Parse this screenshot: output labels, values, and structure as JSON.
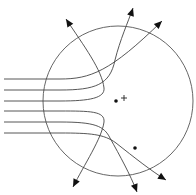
{
  "diagram": {
    "type": "scattering-trajectories",
    "circle": {
      "cx": 118,
      "cy": 101,
      "r": 75,
      "color": "#555555"
    },
    "markers": {
      "center_plus": {
        "x": 124,
        "y": 98,
        "symbol": "+"
      },
      "dots": [
        {
          "x": 116,
          "y": 101
        },
        {
          "x": 135,
          "y": 148
        }
      ]
    },
    "trajectories": [
      {
        "id": "t1",
        "path": "M4,79 L60,79 C90,79 110,72 162,21",
        "tip": {
          "x": 162,
          "y": 21,
          "angle": -44
        }
      },
      {
        "id": "t2",
        "path": "M4,90 L60,90 C95,90 110,85 115,60 C120,40 128,22 133,8",
        "tip": {
          "x": 133,
          "y": 8,
          "angle": -72
        }
      },
      {
        "id": "t3",
        "path": "M4,101 L60,101 C90,101 105,98 104,88 C102,70 84,46 66,19",
        "tip": {
          "x": 66,
          "y": 19,
          "angle": -123
        }
      },
      {
        "id": "t4",
        "path": "M4,111 L60,111 C90,111 105,111 104,122 C102,138 84,165 73,187",
        "tip": {
          "x": 73,
          "y": 187,
          "angle": 117
        }
      },
      {
        "id": "t5",
        "path": "M4,122 L60,122 C95,122 104,126 110,138 C120,156 130,174 137,192",
        "tip": {
          "x": 137,
          "y": 192,
          "angle": 70
        }
      },
      {
        "id": "t6",
        "path": "M4,133 L60,133 C90,133 104,134 116,143 C135,158 150,170 166,180",
        "tip": {
          "x": 166,
          "y": 180,
          "angle": 32
        }
      }
    ]
  }
}
